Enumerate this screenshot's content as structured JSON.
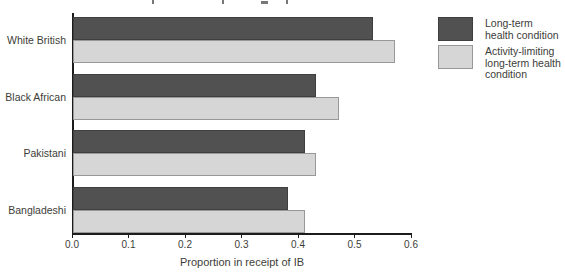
{
  "figure": {
    "x_axis_title": "Proportion in receipt of IB"
  },
  "legend": {
    "items": [
      {
        "label": "Long-term\nhealth condition"
      },
      {
        "label": "Activity-limiting\nlong-term health\ncondition"
      }
    ]
  },
  "chart_data": {
    "type": "bar",
    "orientation": "horizontal",
    "categories": [
      "White British",
      "Black African",
      "Pakistani",
      "Bangladeshi"
    ],
    "series": [
      {
        "name": "Long-term health condition",
        "color": "#515151",
        "border_color": "#3f3f3f",
        "values": [
          0.53,
          0.43,
          0.41,
          0.38
        ]
      },
      {
        "name": "Activity-limiting long-term health condition",
        "color": "#d6d6d6",
        "border_color": "#989898",
        "values": [
          0.57,
          0.47,
          0.43,
          0.41
        ]
      }
    ],
    "xlabel": "Proportion in receipt of IB",
    "xlim": [
      0,
      0.6
    ],
    "xtick_labels": [
      "0.0",
      "0.1",
      "0.2",
      "0.3",
      "0.4",
      "0.5",
      "0.6"
    ],
    "grid": false,
    "legend_position": "right",
    "axis_color": "#1c1c1c",
    "text_color": "#3d3d38"
  }
}
